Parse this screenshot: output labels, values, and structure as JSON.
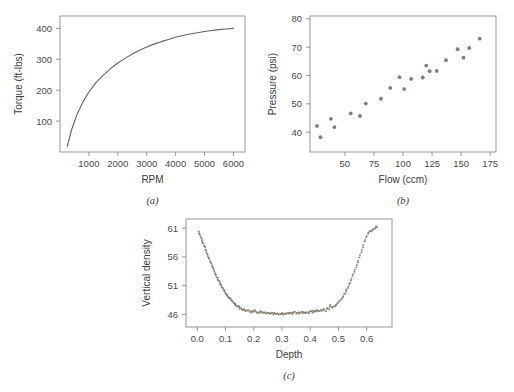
{
  "figure": {
    "background": "#ffffff",
    "axis_color": "#8c8c8c",
    "text_color": "#3b3b3b",
    "curve_color": "#6b6258",
    "marker_color": "#857c72"
  },
  "panels": [
    {
      "id": "a",
      "caption": "(a)",
      "xlabel": "RPM",
      "ylabel": "Torque (ft-lbs)",
      "xticks": [
        1000,
        2000,
        3000,
        4000,
        5000,
        6000
      ],
      "yticks": [
        100,
        200,
        300,
        400
      ],
      "xlim": [
        0,
        6400
      ],
      "ylim": [
        0,
        440
      ]
    },
    {
      "id": "b",
      "caption": "(b)",
      "xlabel": "Flow (ccm)",
      "ylabel": "Pressure (psi)",
      "xticks": [
        50,
        75,
        100,
        125,
        150,
        175
      ],
      "yticks": [
        40,
        50,
        60,
        70,
        80
      ],
      "xlim": [
        20,
        180
      ],
      "ylim": [
        33,
        81
      ]
    },
    {
      "id": "c",
      "caption": "(c)",
      "xlabel": "Depth",
      "ylabel": "Vertical density",
      "xticks": [
        "0.0",
        "0.1",
        "0.2",
        "0.3",
        "0.4",
        "0.5",
        "0.6"
      ],
      "xtick_values": [
        0.0,
        0.1,
        0.2,
        0.3,
        0.4,
        0.5,
        0.6
      ],
      "yticks": [
        46,
        51,
        56,
        61
      ],
      "xlim": [
        -0.04,
        0.69
      ],
      "ylim": [
        43.8,
        62.6
      ]
    }
  ],
  "chart_data": [
    {
      "type": "line",
      "panel": "a",
      "title": "",
      "xlabel": "RPM",
      "ylabel": "Torque (ft-lbs)",
      "xlim": [
        0,
        6400
      ],
      "ylim": [
        0,
        440
      ],
      "grid": false,
      "legend": "none",
      "description": "Saturating logarithmic torque curve rising steeply then flattening toward 400 ft-lbs",
      "x": [
        250,
        400,
        600,
        800,
        1000,
        1250,
        1500,
        1750,
        2000,
        2250,
        2500,
        2750,
        3000,
        3250,
        3500,
        3750,
        4000,
        4250,
        4500,
        4750,
        5000,
        5250,
        5500,
        5750,
        6000
      ],
      "y": [
        18,
        72,
        124,
        163,
        194,
        225,
        249,
        270,
        288,
        303,
        317,
        329,
        340,
        349,
        357,
        364,
        371,
        377,
        382,
        386,
        390,
        393,
        396,
        398,
        400
      ]
    },
    {
      "type": "scatter",
      "panel": "b",
      "title": "",
      "xlabel": "Flow (ccm)",
      "ylabel": "Pressure (psi)",
      "xlim": [
        20,
        180
      ],
      "ylim": [
        33,
        81
      ],
      "grid": false,
      "legend": "none",
      "description": "Positively correlated scatter of pressure versus flow with moderate spread",
      "x": [
        26,
        29,
        38,
        41,
        55,
        63,
        68,
        81,
        89,
        97,
        101,
        107,
        117,
        120,
        123,
        129,
        137,
        147,
        152,
        157,
        166
      ],
      "y": [
        42.2,
        38.2,
        44.7,
        41.8,
        46.6,
        45.7,
        50.1,
        51.8,
        55.6,
        59.4,
        55.2,
        58.8,
        59.3,
        63.5,
        61.5,
        61.6,
        65.4,
        69.3,
        66.3,
        69.7,
        73.0
      ]
    },
    {
      "type": "scatter",
      "panel": "c",
      "title": "",
      "xlabel": "Depth",
      "ylabel": "Vertical density",
      "xlim": [
        -0.04,
        0.69
      ],
      "ylim": [
        43.8,
        62.6
      ],
      "grid": false,
      "legend": "none",
      "description": "Dense U-shaped (bathtub) profile of vertical density versus depth: high at both edges, flat noisy minimum near 46 between depth 0.15 and 0.45",
      "x": [
        0.005,
        0.009,
        0.013,
        0.017,
        0.021,
        0.025,
        0.029,
        0.033,
        0.037,
        0.041,
        0.045,
        0.049,
        0.053,
        0.057,
        0.061,
        0.065,
        0.069,
        0.073,
        0.077,
        0.081,
        0.085,
        0.089,
        0.093,
        0.097,
        0.101,
        0.105,
        0.109,
        0.113,
        0.117,
        0.121,
        0.125,
        0.129,
        0.133,
        0.137,
        0.141,
        0.145,
        0.149,
        0.155,
        0.161,
        0.167,
        0.173,
        0.179,
        0.185,
        0.191,
        0.197,
        0.203,
        0.209,
        0.215,
        0.221,
        0.227,
        0.233,
        0.239,
        0.245,
        0.251,
        0.257,
        0.263,
        0.269,
        0.275,
        0.281,
        0.287,
        0.293,
        0.299,
        0.305,
        0.311,
        0.317,
        0.323,
        0.329,
        0.335,
        0.341,
        0.347,
        0.353,
        0.359,
        0.365,
        0.371,
        0.377,
        0.383,
        0.389,
        0.395,
        0.401,
        0.407,
        0.413,
        0.419,
        0.425,
        0.431,
        0.437,
        0.443,
        0.449,
        0.455,
        0.461,
        0.467,
        0.473,
        0.479,
        0.485,
        0.491,
        0.497,
        0.503,
        0.509,
        0.515,
        0.521,
        0.527,
        0.533,
        0.539,
        0.545,
        0.551,
        0.557,
        0.563,
        0.569,
        0.575,
        0.581,
        0.587,
        0.593,
        0.599,
        0.605,
        0.611,
        0.617,
        0.623,
        0.629,
        0.634
      ],
      "y": [
        60.4,
        59.9,
        59.3,
        58.8,
        58.3,
        57.8,
        57.3,
        56.8,
        56.3,
        55.8,
        55.3,
        54.8,
        54.3,
        53.9,
        53.4,
        53.0,
        52.5,
        52.1,
        51.7,
        51.3,
        51.0,
        50.6,
        50.3,
        50.0,
        49.6,
        49.4,
        49.1,
        48.8,
        48.8,
        48.5,
        48.2,
        48.0,
        47.8,
        47.6,
        47.5,
        47.3,
        47.2,
        47.0,
        46.9,
        46.8,
        46.7,
        46.6,
        46.7,
        46.5,
        46.5,
        46.6,
        46.4,
        46.4,
        46.5,
        46.3,
        46.3,
        46.4,
        46.2,
        46.2,
        46.3,
        46.1,
        46.1,
        46.2,
        46.0,
        46.1,
        46.0,
        46.1,
        46.0,
        46.1,
        46.2,
        46.1,
        46.2,
        46.1,
        46.2,
        46.3,
        46.2,
        46.3,
        46.2,
        46.3,
        46.4,
        46.3,
        46.4,
        46.3,
        46.4,
        46.5,
        46.4,
        46.5,
        46.6,
        46.5,
        46.6,
        46.7,
        46.8,
        46.7,
        46.9,
        47.0,
        47.6,
        47.2,
        47.4,
        47.6,
        47.9,
        48.2,
        48.6,
        49.0,
        49.5,
        50.0,
        50.6,
        51.2,
        51.9,
        52.6,
        53.4,
        54.2,
        55.0,
        55.9,
        56.8,
        57.7,
        58.6,
        59.4,
        60.0,
        60.4,
        60.6,
        60.8,
        61.0,
        61.2
      ]
    }
  ]
}
